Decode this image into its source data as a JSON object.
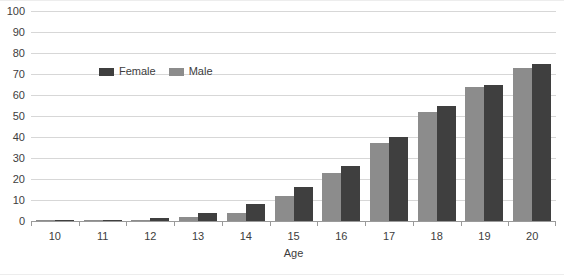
{
  "chart_data": {
    "type": "bar",
    "title": "",
    "xlabel": "Age",
    "ylabel": "",
    "categories": [
      "10",
      "11",
      "12",
      "13",
      "14",
      "15",
      "16",
      "17",
      "18",
      "19",
      "20"
    ],
    "series": [
      {
        "name": "Male",
        "color": "#8c8c8c",
        "values": [
          0.2,
          0.4,
          0.6,
          2,
          4,
          12,
          23,
          37,
          52,
          64,
          73
        ]
      },
      {
        "name": "Female",
        "color": "#3f3f3f",
        "values": [
          0.3,
          0.6,
          1.5,
          4,
          8,
          16,
          26,
          40,
          55,
          65,
          75
        ]
      }
    ],
    "ylim": [
      0,
      100
    ],
    "yticks": [
      100,
      90,
      80,
      70,
      60,
      50,
      40,
      30,
      20,
      10,
      0
    ],
    "grid": true,
    "legend_position": "inside-top-left",
    "bar_order": [
      "Male",
      "Female"
    ]
  },
  "legend": {
    "items": [
      {
        "label": "Female",
        "swatch": "female"
      },
      {
        "label": "Male",
        "swatch": "male"
      }
    ]
  },
  "axis": {
    "x_title": "Age"
  }
}
